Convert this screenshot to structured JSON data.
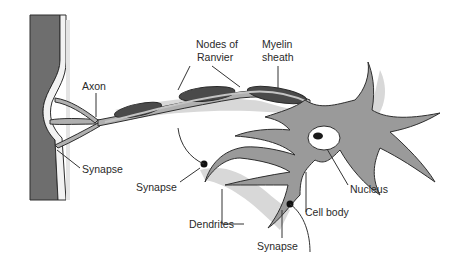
{
  "diagram": {
    "labels": {
      "axon": "Axon",
      "nodes_of_ranvier_line1": "Nodes of",
      "nodes_of_ranvier_line2": "Ranvier",
      "myelin_line1": "Myelin",
      "myelin_line2": "sheath",
      "synapse_left": "Synapse",
      "synapse_middle": "Synapse",
      "synapse_bottom": "Synapse",
      "nucleus": "Nucleus",
      "cell_body": "Cell body",
      "dendrites": "Dendrites"
    },
    "colors": {
      "target_cell": "#6e6e6e",
      "neuron_fill": "#9a9a9a",
      "myelin": "#4a4a4a",
      "shadow": "#d4d4d4",
      "outline": "#2e2e2e",
      "text": "#2a2a2a"
    }
  }
}
